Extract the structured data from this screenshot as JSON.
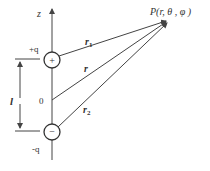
{
  "diagram": {
    "axis_label": "z",
    "positive_charge_label": "+q",
    "negative_charge_label": "-q",
    "positive_symbol": "+",
    "negative_symbol": "−",
    "origin_label": "0",
    "separation_label": "l",
    "point_label": "P(r, θ , φ )",
    "vectors": {
      "r1": "r",
      "r1_sub": "1",
      "r": "r",
      "r2": "r",
      "r2_sub": "2"
    },
    "colors": {
      "line": "#444444",
      "text": "#333333"
    }
  }
}
